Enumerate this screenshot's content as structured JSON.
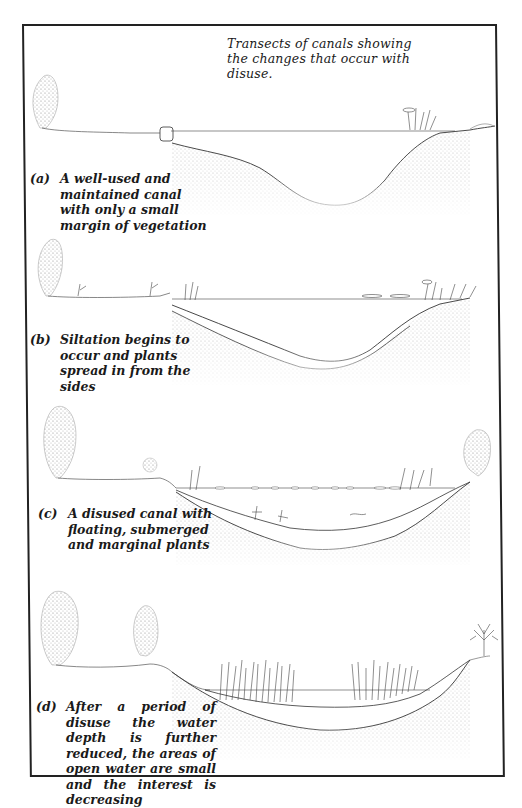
{
  "figure": {
    "title": "Transects of canals showing the changes that occur with disuse.",
    "panels": [
      {
        "label": "(a)",
        "caption": "A well-used and maintained canal with only a small margin of vegetation",
        "stage": "well-used"
      },
      {
        "label": "(b)",
        "caption": "Siltation begins to occur and plants spread in from the sides",
        "stage": "siltation"
      },
      {
        "label": "(c)",
        "caption": "A disused canal with floating, submerged and marginal plants",
        "stage": "disused"
      },
      {
        "label": "(d)",
        "caption": "After a period of disuse the water depth is further reduced, the areas of open water are small and the interest is decreasing",
        "stage": "long-disused"
      }
    ]
  },
  "colors": {
    "ink": "#1a1a1a",
    "stipple": "#8a8a8a",
    "frame": "#222222",
    "paper": "#ffffff"
  }
}
